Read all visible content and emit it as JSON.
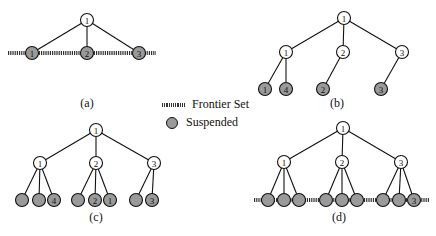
{
  "legend": {
    "frontier_label": "Frontier Set",
    "suspended_label": "Suspended"
  },
  "colors": {
    "suspended_fill": "#9a9a9a",
    "edge": "#111111"
  },
  "panels": [
    {
      "id": "a",
      "caption": "(a)",
      "root": {
        "x": 87,
        "y": 20,
        "label": "1",
        "state": "open"
      },
      "level1": [
        {
          "x": 32,
          "y": 53,
          "label": "1",
          "state": "suspended"
        },
        {
          "x": 87,
          "y": 53,
          "label": "2",
          "state": "suspended"
        },
        {
          "x": 139,
          "y": 53,
          "label": "3",
          "state": "suspended"
        }
      ],
      "frontier_y": 53,
      "frontier_x": [
        8,
        156
      ]
    },
    {
      "id": "b",
      "caption": "(b)",
      "root": {
        "x": 344,
        "y": 18,
        "label": "1",
        "state": "open"
      },
      "level1": [
        {
          "x": 286,
          "y": 52,
          "label": "1",
          "state": "open"
        },
        {
          "x": 343,
          "y": 52,
          "label": "2",
          "state": "open"
        },
        {
          "x": 402,
          "y": 52,
          "label": "3",
          "state": "open"
        }
      ],
      "leaves": [
        {
          "parent": 0,
          "x": 265,
          "y": 89,
          "label": "1",
          "state": "suspended"
        },
        {
          "parent": 0,
          "x": 286,
          "y": 89,
          "label": "4",
          "state": "suspended"
        },
        {
          "parent": 1,
          "x": 323,
          "y": 89,
          "label": "2",
          "state": "suspended"
        },
        {
          "parent": 2,
          "x": 381,
          "y": 89,
          "label": "3",
          "state": "suspended"
        }
      ]
    },
    {
      "id": "c",
      "caption": "(c)",
      "root": {
        "x": 96,
        "y": 130,
        "label": "1",
        "state": "open"
      },
      "level1": [
        {
          "x": 40,
          "y": 163,
          "label": "1",
          "state": "open"
        },
        {
          "x": 96,
          "y": 163,
          "label": "2",
          "state": "open"
        },
        {
          "x": 154,
          "y": 163,
          "label": "3",
          "state": "open"
        }
      ],
      "leaves": [
        {
          "parent": 0,
          "x": 22,
          "y": 200,
          "label": "",
          "state": "suspended"
        },
        {
          "parent": 0,
          "x": 39,
          "y": 200,
          "label": "",
          "state": "suspended"
        },
        {
          "parent": 0,
          "x": 54,
          "y": 200,
          "label": "4",
          "state": "suspended"
        },
        {
          "parent": 1,
          "x": 78,
          "y": 200,
          "label": "",
          "state": "suspended"
        },
        {
          "parent": 1,
          "x": 95,
          "y": 200,
          "label": "2",
          "state": "suspended"
        },
        {
          "parent": 1,
          "x": 110,
          "y": 200,
          "label": "1",
          "state": "suspended"
        },
        {
          "parent": 2,
          "x": 136,
          "y": 200,
          "label": "",
          "state": "suspended"
        },
        {
          "parent": 2,
          "x": 152,
          "y": 200,
          "label": "3",
          "state": "suspended"
        }
      ],
      "sublabel": ""
    },
    {
      "id": "d",
      "caption": "(d)",
      "root": {
        "x": 343,
        "y": 128,
        "label": "1",
        "state": "open"
      },
      "level1": [
        {
          "x": 284,
          "y": 162,
          "label": "1",
          "state": "open"
        },
        {
          "x": 342,
          "y": 162,
          "label": "2",
          "state": "open"
        },
        {
          "x": 401,
          "y": 162,
          "label": "3",
          "state": "open"
        }
      ],
      "leaves": [
        {
          "parent": 0,
          "x": 268,
          "y": 200,
          "label": "",
          "state": "suspended"
        },
        {
          "parent": 0,
          "x": 284,
          "y": 200,
          "label": "",
          "state": "suspended"
        },
        {
          "parent": 0,
          "x": 299,
          "y": 200,
          "label": "",
          "state": "suspended"
        },
        {
          "parent": 1,
          "x": 326,
          "y": 200,
          "label": "",
          "state": "suspended"
        },
        {
          "parent": 1,
          "x": 342,
          "y": 200,
          "label": "",
          "state": "suspended"
        },
        {
          "parent": 1,
          "x": 357,
          "y": 200,
          "label": "",
          "state": "suspended"
        },
        {
          "parent": 2,
          "x": 383,
          "y": 200,
          "label": "",
          "state": "suspended"
        },
        {
          "parent": 2,
          "x": 399,
          "y": 200,
          "label": "",
          "state": "suspended"
        },
        {
          "parent": 2,
          "x": 414,
          "y": 200,
          "label": "3",
          "state": "suspended"
        }
      ],
      "frontier_y": 200,
      "frontier_x": [
        254,
        430
      ]
    }
  ],
  "captions": {
    "a": "(a)",
    "b": "(b)",
    "c": "(c)",
    "d": "(d)"
  }
}
